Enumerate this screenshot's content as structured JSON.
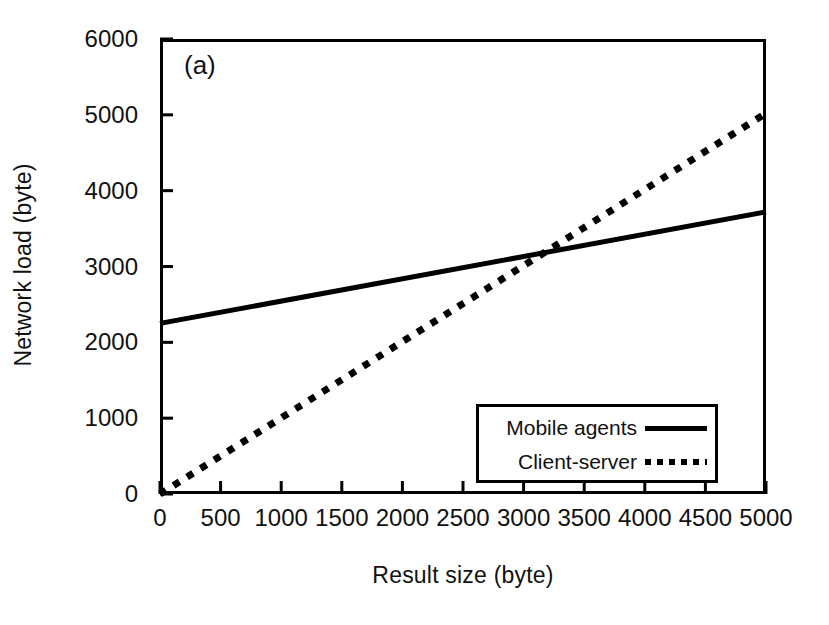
{
  "chart_data": {
    "type": "line",
    "title": "",
    "panel_label": "(a)",
    "xlabel": "Result size (byte)",
    "ylabel": "Network load (byte)",
    "xlim": [
      0,
      5000
    ],
    "ylim": [
      0,
      6000
    ],
    "xticks": [
      0,
      500,
      1000,
      1500,
      2000,
      2500,
      3000,
      3500,
      4000,
      4500,
      5000
    ],
    "xtick_labels": [
      "0",
      "500",
      "1000",
      "1500",
      "2000",
      "2500",
      "3000",
      "3500",
      "4000",
      "4500",
      "5000"
    ],
    "yticks": [
      0,
      1000,
      2000,
      3000,
      4000,
      5000,
      6000
    ],
    "ytick_labels": [
      "0",
      "1000",
      "2000",
      "3000",
      "4000",
      "5000",
      "6000"
    ],
    "grid": false,
    "legend_position": "lower right",
    "series": [
      {
        "name": "Mobile agents",
        "style": "solid",
        "color": "#000000",
        "x": [
          0,
          5000
        ],
        "values": [
          2250,
          3720
        ]
      },
      {
        "name": "Client-server",
        "style": "dotted",
        "color": "#000000",
        "x": [
          0,
          5000
        ],
        "values": [
          0,
          5020
        ]
      }
    ],
    "annotations": [
      {
        "text": "intersection",
        "x": 3170,
        "y": 3170
      }
    ]
  },
  "legend": {
    "entries": [
      {
        "label": "Mobile agents",
        "style": "solid"
      },
      {
        "label": "Client-server",
        "style": "dotted"
      }
    ]
  }
}
